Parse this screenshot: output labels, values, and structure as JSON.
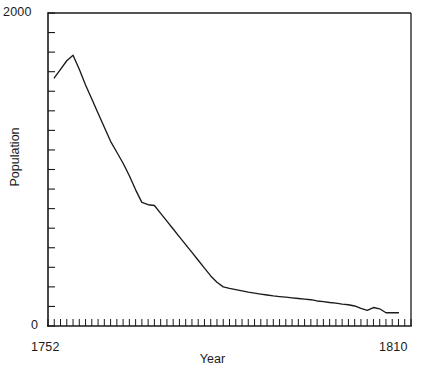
{
  "chart_data": {
    "type": "line",
    "title": "",
    "subtitle": "",
    "xlabel": "Year",
    "ylabel": "Population",
    "xlim": [
      1752,
      1810
    ],
    "ylim": [
      0,
      2000
    ],
    "xticklabels": [
      "1752",
      "1810"
    ],
    "yticklabels": [
      "2000",
      "0"
    ],
    "grid": false,
    "legend": null,
    "annotations": [],
    "x_tick_interval": 1,
    "y_tick_interval": 125,
    "series": [
      {
        "name": "Population",
        "color": "#1a1a1a",
        "x": [
          1753,
          1754,
          1755,
          1756,
          1757,
          1758,
          1759,
          1760,
          1761,
          1762,
          1763,
          1764,
          1765,
          1766,
          1767,
          1768,
          1769,
          1770,
          1771,
          1772,
          1773,
          1774,
          1775,
          1776,
          1777,
          1778,
          1779,
          1780,
          1781,
          1782,
          1783,
          1784,
          1785,
          1786,
          1787,
          1788,
          1789,
          1790,
          1791,
          1792,
          1793,
          1794,
          1795,
          1796,
          1797,
          1798,
          1799,
          1800,
          1801,
          1802,
          1803,
          1804,
          1805,
          1806,
          1807,
          1808
        ],
        "y": [
          1585,
          1640,
          1695,
          1730,
          1640,
          1540,
          1450,
          1360,
          1270,
          1180,
          1110,
          1040,
          960,
          870,
          790,
          775,
          770,
          720,
          670,
          620,
          570,
          520,
          470,
          420,
          370,
          320,
          280,
          250,
          240,
          232,
          224,
          216,
          210,
          204,
          198,
          192,
          188,
          184,
          180,
          176,
          172,
          168,
          160,
          156,
          150,
          146,
          140,
          136,
          128,
          112,
          100,
          118,
          110,
          85,
          85,
          85
        ]
      }
    ]
  },
  "axis": {
    "y_top_label": "2000",
    "y_bottom_label": "0",
    "x_left_label": "1752",
    "x_right_label": "1810",
    "x_title": "Year",
    "y_title": "Population"
  },
  "colors": {
    "ink": "#1a1a1a",
    "background": "#ffffff"
  }
}
